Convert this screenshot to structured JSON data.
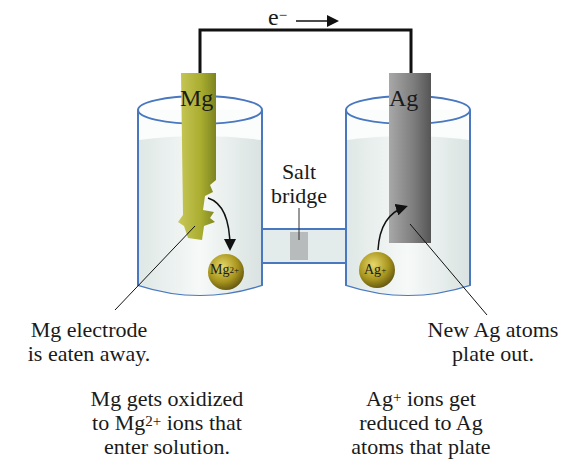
{
  "diagram": {
    "type": "galvanic-cell",
    "electron_flow": {
      "label": "e",
      "superscript": "−",
      "direction": "left-to-right"
    },
    "anode": {
      "label": "Mg",
      "color": "#b5b83a",
      "ion_label": "Mg",
      "ion_charge": "2+"
    },
    "cathode": {
      "label": "Ag",
      "color": "#8e8e8e",
      "ion_label": "Ag",
      "ion_charge": "+"
    },
    "salt_bridge": {
      "line1": "Salt",
      "line2": "bridge"
    },
    "colors": {
      "wire": "#111111",
      "beaker_outline": "#4a78c0",
      "solution": "#e9f0ee",
      "ion": "#a8951e"
    }
  },
  "captions": {
    "mg_electrode": {
      "line1": "Mg electrode",
      "line2": "is eaten away."
    },
    "ag_atoms": {
      "line1": "New Ag atoms",
      "line2": "plate out."
    },
    "mg_oxidized": {
      "line1": "Mg gets oxidized",
      "line2_pre": "to Mg",
      "line2_sup": "2+",
      "line2_post": " ions that",
      "line3": "enter solution."
    },
    "ag_reduced": {
      "line1_pre": "Ag",
      "line1_sup": "+",
      "line1_post": " ions get",
      "line2": "reduced to Ag",
      "line3": "atoms that plate"
    }
  }
}
